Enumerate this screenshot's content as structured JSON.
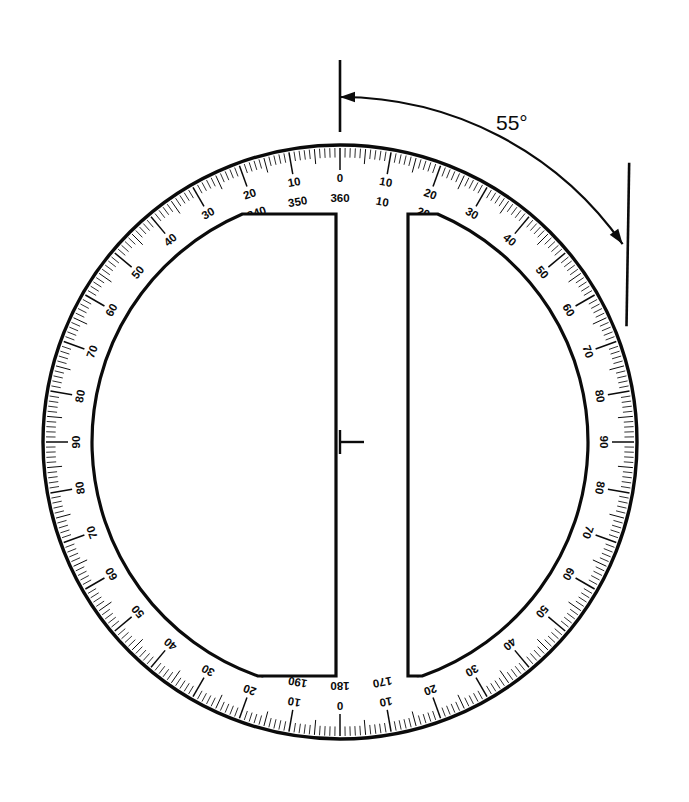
{
  "figure": {
    "background_color": "#ffffff",
    "ink_color": "#0b0b0b"
  },
  "annotation": {
    "angle_label": "55°",
    "angle_value": 55,
    "reference_mark_label": "zero-reference-tick",
    "arc_start_deg": 0,
    "arc_end_deg": 55
  },
  "protractor": {
    "center": {
      "x": 340,
      "y": 442
    },
    "outer_radius": 297,
    "scale_band_inner_radius": 248,
    "cutout": {
      "left_edge_x": 336,
      "right_edge_x": 408,
      "top_y": 214,
      "bottom_y": 676
    },
    "tick_spacing_degrees": 1,
    "major_tick_every_degrees": 10,
    "medium_tick_every_degrees": 5
  },
  "chart_data": {
    "type": "scatter",
    "xlabel": "",
    "ylabel": "",
    "outer_scale": {
      "name": "outer-scale-clockwise",
      "direction": "clockwise",
      "zero_at_top_label": "360",
      "labels": [
        "360",
        "10",
        "20",
        "30",
        "40",
        "50",
        "60",
        "70",
        "80",
        "90",
        "100",
        "110",
        "120",
        "130",
        "140",
        "150",
        "160",
        "170",
        "180",
        "190",
        "200",
        "210",
        "220",
        "230",
        "240",
        "250",
        "260",
        "270",
        "280",
        "290",
        "300",
        "310",
        "320",
        "330",
        "340",
        "350"
      ],
      "values": [
        360,
        10,
        20,
        30,
        40,
        50,
        60,
        70,
        80,
        90,
        100,
        110,
        120,
        130,
        140,
        150,
        160,
        170,
        180,
        190,
        200,
        210,
        220,
        230,
        240,
        250,
        260,
        270,
        280,
        290,
        300,
        310,
        320,
        330,
        340,
        350
      ]
    },
    "inner_scale": {
      "name": "inner-scale-quadrant",
      "direction": "quadrant 0-90-0",
      "zero_at_top_label": "0",
      "labels": [
        "0",
        "10",
        "20",
        "30",
        "40",
        "50",
        "60",
        "70",
        "80",
        "90",
        "80",
        "70",
        "60",
        "50",
        "40",
        "30",
        "20",
        "10",
        "0",
        "10",
        "20",
        "30",
        "40",
        "50",
        "60",
        "70",
        "80",
        "90",
        "80",
        "70",
        "60",
        "50",
        "40",
        "30",
        "20",
        "10"
      ],
      "values": [
        0,
        10,
        20,
        30,
        40,
        50,
        60,
        70,
        80,
        90,
        80,
        70,
        60,
        50,
        40,
        30,
        20,
        10,
        0,
        10,
        20,
        30,
        40,
        50,
        60,
        70,
        80,
        90,
        80,
        70,
        60,
        50,
        40,
        30,
        20,
        10
      ]
    },
    "annotations": [
      "55°"
    ],
    "grid": false,
    "legend": "none"
  }
}
